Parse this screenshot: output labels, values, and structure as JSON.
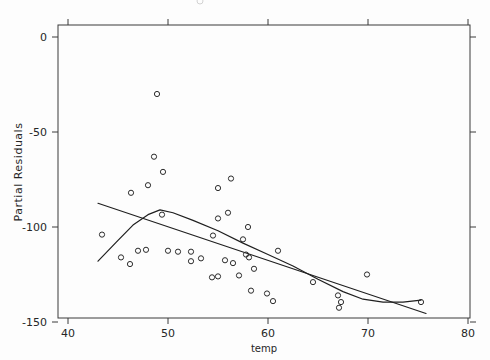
{
  "chart_data": {
    "type": "scatter",
    "title": "",
    "xlabel": "temp",
    "ylabel": "Partial Residuals",
    "xlim": [
      40,
      80
    ],
    "ylim": [
      -150,
      0
    ],
    "grid": false,
    "legend": "none",
    "x_ticks": [
      40,
      50,
      60,
      70,
      80
    ],
    "x_tick_labels": [
      "40",
      "50",
      "60",
      "70",
      "80"
    ],
    "y_ticks": [
      0,
      -50,
      -100,
      -150
    ],
    "y_tick_labels": [
      "0",
      "-50",
      "-100",
      "-150"
    ],
    "marker": "open-circle",
    "points": [
      {
        "x": 48.9,
        "y": -30.0
      },
      {
        "x": 48.6,
        "y": -63.0
      },
      {
        "x": 49.5,
        "y": -71.0
      },
      {
        "x": 48.0,
        "y": -78.0
      },
      {
        "x": 46.3,
        "y": -82.0
      },
      {
        "x": 55.0,
        "y": -79.5
      },
      {
        "x": 56.3,
        "y": -74.5
      },
      {
        "x": 49.4,
        "y": -93.5
      },
      {
        "x": 55.0,
        "y": -95.5
      },
      {
        "x": 56.0,
        "y": -92.5
      },
      {
        "x": 43.4,
        "y": -104.0
      },
      {
        "x": 47.0,
        "y": -112.5
      },
      {
        "x": 47.8,
        "y": -112.0
      },
      {
        "x": 50.0,
        "y": -112.5
      },
      {
        "x": 51.0,
        "y": -113.0
      },
      {
        "x": 45.3,
        "y": -116.0
      },
      {
        "x": 46.2,
        "y": -119.5
      },
      {
        "x": 52.3,
        "y": -113.0
      },
      {
        "x": 52.3,
        "y": -118.0
      },
      {
        "x": 53.3,
        "y": -116.5
      },
      {
        "x": 54.5,
        "y": -104.5
      },
      {
        "x": 55.7,
        "y": -117.5
      },
      {
        "x": 56.5,
        "y": -119.0
      },
      {
        "x": 57.5,
        "y": -106.5
      },
      {
        "x": 57.8,
        "y": -114.5
      },
      {
        "x": 58.1,
        "y": -116.0
      },
      {
        "x": 58.6,
        "y": -122.0
      },
      {
        "x": 57.1,
        "y": -125.5
      },
      {
        "x": 54.4,
        "y": -126.5
      },
      {
        "x": 55.0,
        "y": -126.0
      },
      {
        "x": 58.0,
        "y": -100.0
      },
      {
        "x": 61.0,
        "y": -112.5
      },
      {
        "x": 58.3,
        "y": -133.5
      },
      {
        "x": 59.9,
        "y": -135.0
      },
      {
        "x": 60.5,
        "y": -139.0
      },
      {
        "x": 64.5,
        "y": -129.0
      },
      {
        "x": 67.0,
        "y": -136.0
      },
      {
        "x": 67.3,
        "y": -139.5
      },
      {
        "x": 67.1,
        "y": -142.5
      },
      {
        "x": 69.9,
        "y": -125.0
      },
      {
        "x": 75.3,
        "y": -139.5
      }
    ],
    "series": [
      {
        "name": "linear-fit",
        "type": "line",
        "points": [
          {
            "x": 43.0,
            "y": -87.5
          },
          {
            "x": 75.8,
            "y": -145.5
          }
        ]
      },
      {
        "name": "smooth-fit",
        "type": "line",
        "points": [
          {
            "x": 43.0,
            "y": -118.0
          },
          {
            "x": 45.0,
            "y": -107.0
          },
          {
            "x": 46.5,
            "y": -99.0
          },
          {
            "x": 48.0,
            "y": -93.5
          },
          {
            "x": 49.2,
            "y": -91.0
          },
          {
            "x": 50.5,
            "y": -92.5
          },
          {
            "x": 52.5,
            "y": -96.5
          },
          {
            "x": 55.0,
            "y": -102.0
          },
          {
            "x": 57.5,
            "y": -108.5
          },
          {
            "x": 60.0,
            "y": -114.5
          },
          {
            "x": 62.5,
            "y": -120.5
          },
          {
            "x": 65.0,
            "y": -127.5
          },
          {
            "x": 67.5,
            "y": -134.0
          },
          {
            "x": 69.5,
            "y": -138.0
          },
          {
            "x": 71.5,
            "y": -139.5
          },
          {
            "x": 73.5,
            "y": -139.5
          },
          {
            "x": 75.3,
            "y": -138.5
          }
        ]
      }
    ]
  },
  "axes": {
    "x_axis_label": "temp",
    "y_axis_label": "Partial Residuals"
  }
}
